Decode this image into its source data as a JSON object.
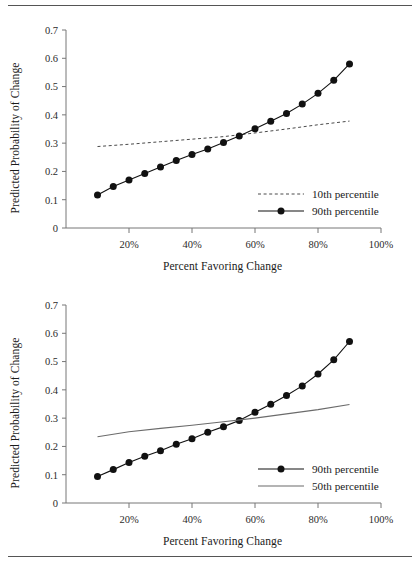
{
  "page": {
    "top_rule": "horizontal-rule",
    "bottom_rule": "horizontal-rule",
    "clipped_header_text": ""
  },
  "chart_data": [
    {
      "id": "top-chart",
      "type": "line",
      "title": "",
      "xlabel": "Percent Favoring Change",
      "ylabel": "Predicted Probability of Change",
      "xlim": [
        0,
        100
      ],
      "ylim": [
        0,
        0.7
      ],
      "grid": false,
      "legend_position": "inside-lower-right",
      "xticks": [
        20,
        40,
        60,
        80,
        100
      ],
      "xtick_labels": [
        "20%",
        "40%",
        "60%",
        "80%",
        "100%"
      ],
      "yticks": [
        0,
        0.1,
        0.2,
        0.3,
        0.4,
        0.5,
        0.6,
        0.7
      ],
      "ytick_labels": [
        "0",
        "0.1",
        "0.2",
        "0.3",
        "0.4",
        "0.5",
        "0.6",
        "0.7"
      ],
      "x": [
        10,
        15,
        20,
        25,
        30,
        35,
        40,
        45,
        50,
        55,
        60,
        65,
        70,
        75,
        80,
        85,
        90
      ],
      "series": [
        {
          "name": "10th percentile",
          "style": "dashed",
          "marker": "none",
          "color": "#4a4a4a",
          "x": [
            10,
            20,
            30,
            40,
            50,
            60,
            70,
            80,
            90
          ],
          "values": [
            0.288,
            0.296,
            0.305,
            0.314,
            0.323,
            0.336,
            0.35,
            0.365,
            0.378
          ]
        },
        {
          "name": "90th percentile",
          "style": "solid",
          "marker": "circle",
          "color": "#111111",
          "x": [
            10,
            15,
            20,
            25,
            30,
            35,
            40,
            45,
            50,
            55,
            60,
            65,
            70,
            75,
            80,
            85,
            90
          ],
          "values": [
            0.117,
            0.147,
            0.17,
            0.193,
            0.216,
            0.239,
            0.26,
            0.279,
            0.302,
            0.325,
            0.351,
            0.377,
            0.405,
            0.438,
            0.476,
            0.522,
            0.58
          ]
        }
      ]
    },
    {
      "id": "bottom-chart",
      "type": "line",
      "title": "",
      "xlabel": "Percent Favoring Change",
      "ylabel": "Predicted Probability of Change",
      "xlim": [
        0,
        100
      ],
      "ylim": [
        0,
        0.7
      ],
      "grid": false,
      "legend_position": "inside-lower-right",
      "xticks": [
        20,
        40,
        60,
        80,
        100
      ],
      "xtick_labels": [
        "20%",
        "40%",
        "60%",
        "80%",
        "100%"
      ],
      "yticks": [
        0,
        0.1,
        0.2,
        0.3,
        0.4,
        0.5,
        0.6,
        0.7
      ],
      "ytick_labels": [
        "0",
        "0.1",
        "0.2",
        "0.3",
        "0.4",
        "0.5",
        "0.6",
        "0.7"
      ],
      "x": [
        10,
        15,
        20,
        25,
        30,
        35,
        40,
        45,
        50,
        55,
        60,
        65,
        70,
        75,
        80,
        85,
        90
      ],
      "series": [
        {
          "name": "90th percentile",
          "style": "solid",
          "marker": "circle",
          "color": "#111111",
          "x": [
            10,
            15,
            20,
            25,
            30,
            35,
            40,
            45,
            50,
            55,
            60,
            65,
            70,
            75,
            80,
            85,
            90
          ],
          "values": [
            0.094,
            0.118,
            0.143,
            0.165,
            0.185,
            0.208,
            0.227,
            0.25,
            0.27,
            0.292,
            0.321,
            0.349,
            0.38,
            0.414,
            0.456,
            0.506,
            0.571
          ]
        },
        {
          "name": "50th percentile",
          "style": "solid",
          "marker": "none",
          "color": "#6b6b6b",
          "x": [
            10,
            20,
            30,
            40,
            50,
            60,
            70,
            80,
            90
          ],
          "values": [
            0.234,
            0.252,
            0.264,
            0.275,
            0.287,
            0.3,
            0.315,
            0.33,
            0.348
          ]
        }
      ]
    }
  ]
}
